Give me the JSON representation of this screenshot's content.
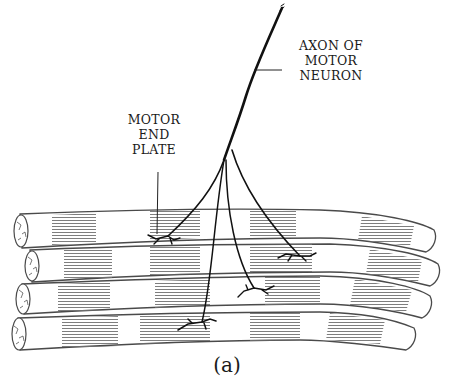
{
  "figure": {
    "caption": "(a)",
    "labels": {
      "axon": {
        "line1": "AXON OF",
        "line2": "MOTOR",
        "line3": "NEURON"
      },
      "end_plate": {
        "line1": "MOTOR",
        "line2": "END",
        "line3": "PLATE"
      }
    },
    "structures": {
      "muscle_fibers": 4,
      "axon_branches": 4,
      "motor_end_plates": 4
    },
    "colors": {
      "ink": "#111111",
      "fiber_outline": "#4a4a4a",
      "striation": "#777777",
      "background": "#ffffff"
    }
  }
}
